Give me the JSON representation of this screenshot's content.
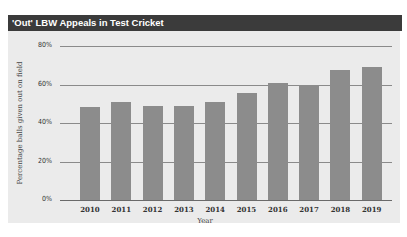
{
  "header": {
    "title": "'Out' LBW Appeals in Test Cricket"
  },
  "colors": {
    "header_bg": "#3b3b3b",
    "panel_bg": "#ebebeb",
    "bar": "#8c8c8c",
    "gridline": "#8a8a8a"
  },
  "chart_data": {
    "type": "bar",
    "title": "'Out' LBW Appeals in Test Cricket",
    "xlabel": "Year",
    "ylabel": "Percentage balls given out on field",
    "categories": [
      "2010",
      "2011",
      "2012",
      "2013",
      "2014",
      "2015",
      "2016",
      "2017",
      "2018",
      "2019"
    ],
    "values": [
      48.5,
      51,
      49,
      49,
      51,
      55.5,
      61,
      60,
      67.5,
      69
    ],
    "value_format": "percent",
    "ylim": [
      0,
      80
    ],
    "yticks": [
      "0%",
      "20%",
      "40%",
      "60%",
      "80%"
    ],
    "grid": true,
    "legend": null
  }
}
